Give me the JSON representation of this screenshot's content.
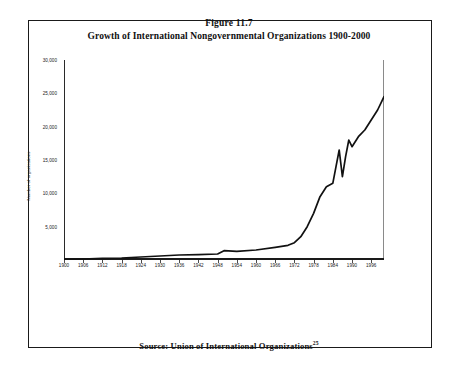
{
  "figure": {
    "number_label": "Figure 11.7",
    "title": "Growth of International Nongovernmental Organizations 1900-2000",
    "source_text": "Source: Union of International Organizations",
    "source_superscript": "25"
  },
  "chart_data": {
    "type": "line",
    "title": "Growth of International Nongovernmental Organizations 1900-2000",
    "xlabel": "",
    "ylabel": "Number of organizations",
    "xlim": [
      1900,
      2000
    ],
    "ylim": [
      0,
      30000
    ],
    "grid": false,
    "legend": null,
    "y_ticks": [
      5000,
      10000,
      15000,
      20000,
      25000,
      30000
    ],
    "y_tick_labels": [
      "5,000",
      "10,000",
      "15,000",
      "20,000",
      "25,000",
      "30,000"
    ],
    "x_ticks": [
      1900,
      1906,
      1912,
      1918,
      1924,
      1930,
      1936,
      1942,
      1948,
      1954,
      1960,
      1966,
      1972,
      1978,
      1984,
      1990,
      1996
    ],
    "x_tick_labels": [
      "1900",
      "1906",
      "1912",
      "1918",
      "1924",
      "1930",
      "1936",
      "1942",
      "1948",
      "1954",
      "1960",
      "1966",
      "1972",
      "1978",
      "1984",
      "1990",
      "1996"
    ],
    "series": [
      {
        "name": "International nongovernmental organizations",
        "color": "#111111",
        "x": [
          1900,
          1906,
          1912,
          1918,
          1924,
          1930,
          1936,
          1942,
          1948,
          1950,
          1954,
          1960,
          1966,
          1970,
          1972,
          1974,
          1976,
          1978,
          1980,
          1982,
          1984,
          1985,
          1986,
          1987,
          1988,
          1989,
          1990,
          1992,
          1994,
          1996,
          1998,
          2000
        ],
        "values": [
          100,
          150,
          250,
          300,
          450,
          600,
          750,
          800,
          900,
          1400,
          1300,
          1500,
          1900,
          2200,
          2600,
          3500,
          5000,
          7000,
          9500,
          11000,
          11500,
          14000,
          16500,
          12500,
          15500,
          18000,
          17000,
          18500,
          19500,
          21000,
          22500,
          24500
        ]
      }
    ]
  }
}
